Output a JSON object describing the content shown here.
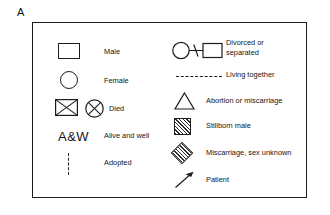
{
  "panel": {
    "label": "A"
  },
  "legend": {
    "left_column": [
      {
        "id": "male",
        "icon": "square-symbol",
        "label": "Male"
      },
      {
        "id": "female",
        "icon": "circle-symbol",
        "label": "Female"
      },
      {
        "id": "died",
        "icon": "crossed-square-and-crossed-circle-symbol",
        "label": "Died"
      },
      {
        "id": "alive-and-well",
        "icon": "a-and-w-text-symbol",
        "glyph": "A&W",
        "label": "Alive and well"
      },
      {
        "id": "adopted",
        "icon": "vertical-dashed-line-symbol",
        "label": "Adopted"
      }
    ],
    "right_column": [
      {
        "id": "divorced",
        "icon": "circle-slash-square-symbol",
        "label": "Divorced or separated",
        "label_line1": "Divorced or",
        "label_line2": "separated"
      },
      {
        "id": "living-together",
        "icon": "horizontal-dashed-line-symbol",
        "label": "Living together"
      },
      {
        "id": "abortion",
        "icon": "triangle-symbol",
        "label": "Abortion or miscarriage"
      },
      {
        "id": "stillborn-male",
        "icon": "hatched-square-symbol",
        "label": "Stillborn male"
      },
      {
        "id": "miscarriage-sex-unknown",
        "icon": "hatched-diamond-symbol",
        "label": "Miscarriage, sex unknown"
      },
      {
        "id": "patient",
        "icon": "arrow-symbol",
        "label": "Patient"
      }
    ]
  },
  "colors": {
    "ink": "#1c1c1c",
    "background": "#ffffff",
    "hatch": "#2b2b2b"
  }
}
